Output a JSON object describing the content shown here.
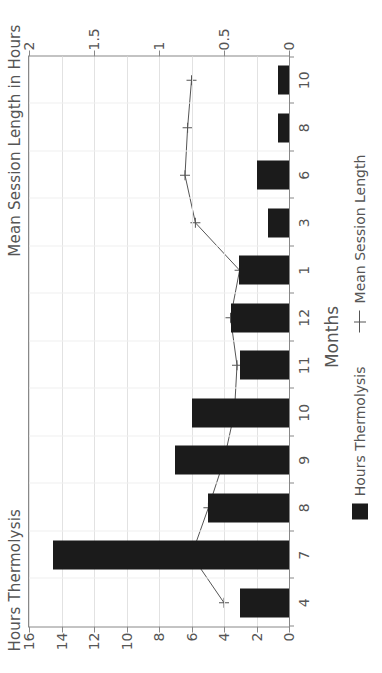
{
  "chart_data": {
    "type": "bar",
    "title": "",
    "left_axis_title": "Hours Thermolysis",
    "right_axis_title": "Mean Session Length in Hours",
    "xlabel": "Months",
    "categories": [
      "4",
      "7",
      "8",
      "9",
      "10",
      "11",
      "12",
      "1",
      "3",
      "6",
      "8",
      "10"
    ],
    "grid": true,
    "legend_position": "bottom",
    "series": [
      {
        "name": "Hours Thermolysis",
        "type": "bar",
        "axis": "left",
        "color": "#1b1b1b",
        "values": [
          3.0,
          14.5,
          5.0,
          7.0,
          6.0,
          3.0,
          3.6,
          3.1,
          1.3,
          2.0,
          0.7,
          0.7
        ]
      },
      {
        "name": "Mean Session Length",
        "type": "line",
        "axis": "right",
        "color": "#555555",
        "marker": "plus",
        "values": [
          0.5,
          0.75,
          0.62,
          0.5,
          0.42,
          0.4,
          0.45,
          0.38,
          0.72,
          0.8,
          0.78,
          0.75
        ]
      }
    ],
    "left_axis": {
      "label": "Hours Thermolysis",
      "ticks": [
        "0",
        "2",
        "4",
        "6",
        "8",
        "10",
        "12",
        "14",
        "16"
      ],
      "min": 0,
      "max": 16
    },
    "right_axis": {
      "label": "Mean Session Length in Hours",
      "ticks": [
        "0",
        "0.5",
        "1",
        "1.5",
        "2"
      ],
      "min": 0,
      "max": 2
    },
    "legend": [
      {
        "label": "Hours Thermolysis",
        "marker": "bar"
      },
      {
        "label": "Mean Session Length",
        "marker": "line-plus"
      }
    ]
  }
}
